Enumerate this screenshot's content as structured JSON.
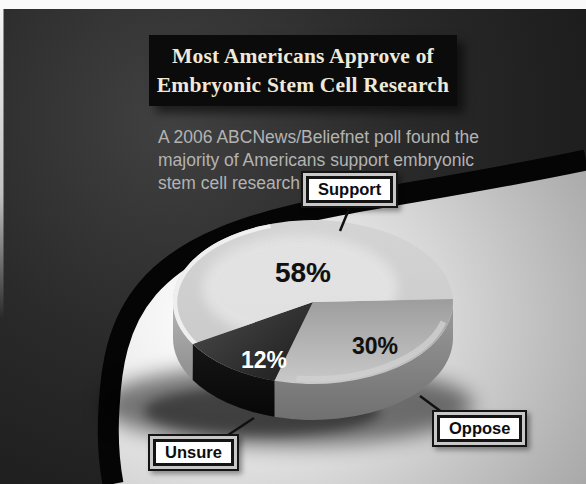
{
  "title": {
    "line1": "Most Americans Approve of",
    "line2": "Embryonic Stem Cell Research"
  },
  "subtitle": {
    "lines": [
      "A 2006 ABCNews/Beliefnet poll found the",
      "majority of Americans support embryonic",
      "stem cell research."
    ]
  },
  "chart_data": {
    "type": "pie",
    "title": "Most Americans Approve of Embryonic Stem Cell Research",
    "style": "3d-exploded-none",
    "legend_position": "callout-boxes",
    "slices": [
      {
        "label": "Support",
        "value": 58,
        "display": "58%",
        "top_color": "#d4d4d4",
        "top_color2": "#cbcbcb",
        "wall_color": "#b5b5b5",
        "wall_color2": "#8d8d8d",
        "text_color": "#101010"
      },
      {
        "label": "Oppose",
        "value": 30,
        "display": "30%",
        "top_color": "#9d9d9d",
        "top_color2": "#c9c9c9",
        "wall_color": "#9b9b9b",
        "wall_color2": "#707070",
        "text_color": "#101010"
      },
      {
        "label": "Unsure",
        "value": 12,
        "display": "12%",
        "top_color": "#4a4a4a",
        "top_color2": "#1d1d1d",
        "wall_color": "#161616",
        "wall_color2": "#070707",
        "text_color": "#ffffff"
      }
    ]
  },
  "colors": {
    "dark_background": "#2b2b2b",
    "swoosh_band": "#050505",
    "light_background": "#d6d6d6",
    "title_box": "#0b0b0b",
    "title_text": "#efe9da",
    "subtitle_text": "#b3b3b3"
  }
}
